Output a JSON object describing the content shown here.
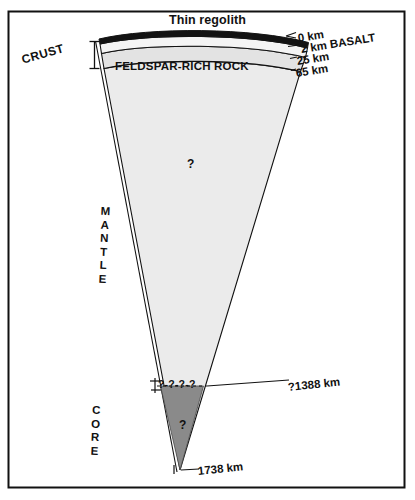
{
  "figure": {
    "title": "Thin regolith",
    "frame_color": "#000000",
    "background": "#ffffff"
  },
  "layers": [
    {
      "id": "regolith_basalt",
      "name": "regolith / basalt",
      "fill": "#111111"
    },
    {
      "id": "upper_crust",
      "name": "upper crust",
      "fill": "#f2f2f2"
    },
    {
      "id": "feldspar_rock",
      "name": "FELDSPAR-RICH ROCK",
      "fill": "#e3e3e3"
    },
    {
      "id": "mantle",
      "name": "MANTLE",
      "fill": "#ebebeb"
    },
    {
      "id": "core",
      "name": "CORE",
      "fill": "#8a8a8a"
    }
  ],
  "labels": {
    "crust": "CRUST",
    "feldspar": "FELDSPAR-RICH ROCK",
    "mantle_letters": [
      "M",
      "A",
      "N",
      "T",
      "L",
      "E"
    ],
    "core_letters": [
      "C",
      "O",
      "R",
      "E"
    ],
    "mantle_query": "?",
    "core_query": "?",
    "core_boundary_dashes": "?-?-?-?"
  },
  "depth_labels": [
    {
      "id": "d0",
      "text": "0 km",
      "depth_km": 0
    },
    {
      "id": "d2",
      "text": "2 km BASALT",
      "depth_km": 2
    },
    {
      "id": "d25",
      "text": "25 km",
      "depth_km": 25
    },
    {
      "id": "d65",
      "text": "65 km",
      "depth_km": 65
    },
    {
      "id": "dcore",
      "text": "?1388 km",
      "depth_km": 1388
    },
    {
      "id": "dradius",
      "text": "1738 km",
      "depth_km": 1738
    }
  ],
  "chart_data": {
    "type": "diagram",
    "title": "Thin regolith",
    "radius_km": 1738,
    "boundaries_km": [
      0,
      2,
      25,
      65,
      1388,
      1738
    ],
    "zones": [
      {
        "name": "Thin regolith",
        "top_km": 0,
        "bottom_km": 2,
        "fill": "#111111"
      },
      {
        "name": "BASALT",
        "top_km": 2,
        "bottom_km": 25,
        "fill": "#f2f2f2"
      },
      {
        "name": "FELDSPAR-RICH ROCK",
        "top_km": 25,
        "bottom_km": 65,
        "fill": "#e3e3e3"
      },
      {
        "name": "MANTLE",
        "top_km": 65,
        "bottom_km": 1388,
        "fill": "#ebebeb"
      },
      {
        "name": "CORE",
        "top_km": 1388,
        "bottom_km": 1738,
        "fill": "#8a8a8a"
      }
    ],
    "uncertain_markers": [
      "?",
      "?-?-?-?",
      "?1388 km"
    ]
  }
}
